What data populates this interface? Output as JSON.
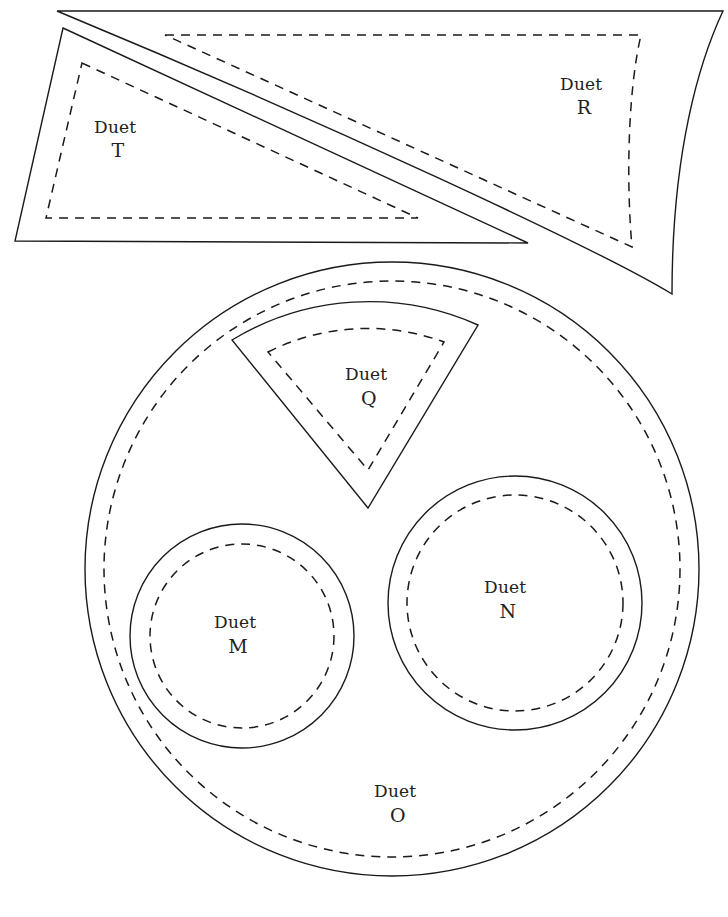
{
  "page": {
    "background_color": "#ffffff",
    "stroke_color": "#1a1a1a",
    "width": 728,
    "height": 917
  },
  "labels": {
    "word": "Duet"
  },
  "pieces": [
    {
      "id": "T",
      "name": "Duet T",
      "word": "Duet",
      "letter": "T",
      "label_x": 118,
      "label_y": 133,
      "shape": "triangle",
      "outline": "M 63,28 L 528,243 L 15,241 Z",
      "seam": "M 82,63 L 418,218 L 46,218 Z"
    },
    {
      "id": "R",
      "name": "Duet R",
      "word": "Duet",
      "letter": "R",
      "label_x": 584,
      "label_y": 90,
      "shape": "curved-quadrilateral",
      "outline": "M 57,11 L 723,11 C 700,60 672,150 672,294 C 600,250 320,120 57,11 Z",
      "seam": "M 165,35 L 641,35 C 628,90 626,180 632,247 L 165,35 Z"
    },
    {
      "id": "O",
      "name": "Duet O",
      "word": "Duet",
      "letter": "O",
      "label_x": 398,
      "label_y": 797,
      "shape": "circle",
      "cx": 392,
      "cy": 569,
      "r_outline": 307,
      "r_seam": 288
    },
    {
      "id": "Q",
      "name": "Duet Q",
      "word": "Duet",
      "letter": "Q",
      "label_x": 369,
      "label_y": 380,
      "shape": "sector",
      "outline": "M 232,340 A 265 265 0 0 1 478,325 L 368,508 Z",
      "seam": "M 268,352 A 222 222 0 0 1 444,342 L 368,470 Z"
    },
    {
      "id": "M",
      "name": "Duet M",
      "word": "Duet",
      "letter": "M",
      "label_x": 238,
      "label_y": 628,
      "shape": "circle",
      "cx": 242,
      "cy": 636,
      "r_outline": 112,
      "r_seam": 92
    },
    {
      "id": "N",
      "name": "Duet N",
      "word": "Duet",
      "letter": "N",
      "label_x": 508,
      "label_y": 593,
      "shape": "circle",
      "cx": 515,
      "cy": 603,
      "r_outline": 127,
      "r_seam": 108
    }
  ]
}
